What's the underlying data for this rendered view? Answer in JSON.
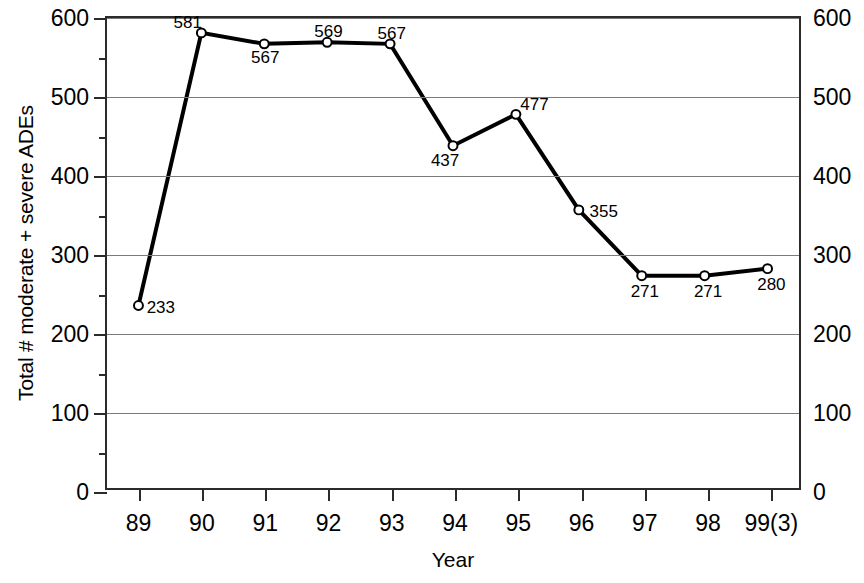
{
  "chart_data": {
    "type": "line",
    "title": "",
    "xlabel": "Year",
    "ylabel": "Total # moderate + severe ADEs",
    "categories": [
      "89",
      "90",
      "91",
      "92",
      "93",
      "94",
      "95",
      "96",
      "97",
      "98",
      "99(3)"
    ],
    "values": [
      233,
      581,
      567,
      569,
      567,
      437,
      477,
      355,
      271,
      271,
      280
    ],
    "series": [
      {
        "name": "Total # moderate + severe ADEs",
        "values": [
          233,
          581,
          567,
          569,
          567,
          437,
          477,
          355,
          271,
          271,
          280
        ]
      }
    ],
    "point_labels": [
      "233",
      "581",
      "567",
      "569",
      "567",
      "437",
      "477",
      "355",
      "271",
      "271",
      "280"
    ],
    "label_positions": [
      "right",
      "above-left",
      "below",
      "above",
      "above",
      "below-left",
      "above-right",
      "right",
      "below",
      "below",
      "below"
    ],
    "ylim": [
      0,
      600
    ],
    "y_major_ticks": [
      0,
      100,
      200,
      300,
      400,
      500,
      600
    ],
    "y_minor_ticks": [
      50,
      150,
      250,
      350,
      450,
      550
    ],
    "y_tick_labels_left": [
      "0",
      "100",
      "200",
      "300",
      "400",
      "500",
      "600"
    ],
    "y_tick_labels_right": [
      "0",
      "100",
      "200",
      "300",
      "400",
      "500",
      "600"
    ],
    "grid": true,
    "grid_axis": "y",
    "legend": "none",
    "line_color": "#000000",
    "marker": "circle-open",
    "marker_fill": "#ffffff",
    "frame_color": "#2b2b2b",
    "grid_color": "#7b7b7b",
    "background": "#ffffff"
  }
}
